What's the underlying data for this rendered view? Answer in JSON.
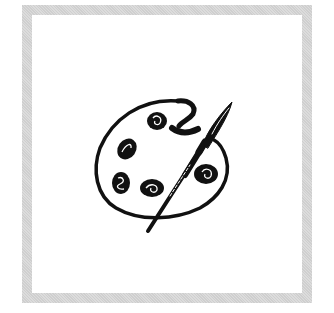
{
  "image": {
    "subject": "paint palette with paintbrush",
    "icon": "palette-icon",
    "colors": {
      "frame": "#d4d4d4",
      "background": "#ffffff",
      "ink": "#111111"
    }
  }
}
